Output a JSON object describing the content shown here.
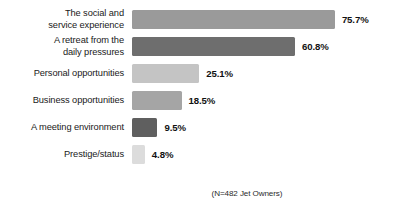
{
  "chart_data": {
    "type": "bar",
    "orientation": "horizontal",
    "title": "",
    "xlabel": "",
    "ylabel": "",
    "grid": false,
    "legend": "none",
    "xlim": [
      0,
      80
    ],
    "categories": [
      "The social and\nservice experience",
      "A retreat from the\ndaily pressures",
      "Personal opportunities",
      "Business opportunities",
      "A meeting environment",
      "Prestige/status"
    ],
    "values": [
      75.7,
      60.8,
      25.1,
      18.5,
      9.5,
      4.8
    ],
    "value_labels": [
      "75.7%",
      "60.8%",
      "25.1%",
      "18.5%",
      "9.5%",
      "4.8%"
    ],
    "bar_colors": [
      "#9a9a9a",
      "#6e6e6e",
      "#c4c4c4",
      "#a5a5a5",
      "#5f5f5f",
      "#dcdcdc"
    ],
    "annotations": [
      "(N=482 Jet Owners)"
    ]
  },
  "footnote": {
    "text": "(N=482 Jet Owners)"
  },
  "scale": {
    "px_per_percent": 2.68
  }
}
